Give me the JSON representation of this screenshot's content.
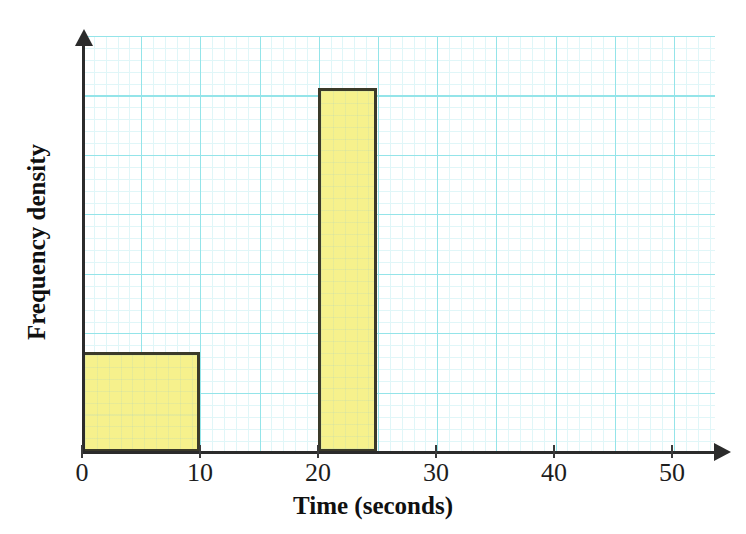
{
  "chart_data": {
    "type": "bar",
    "title": "",
    "xlabel": "Time (seconds)",
    "ylabel": "Frequency density",
    "xlim": [
      0,
      55
    ],
    "ylim": [
      0,
      4.4
    ],
    "grid": true,
    "legend": "none",
    "xticks": [
      0,
      10,
      20,
      30,
      40,
      50
    ],
    "xtick_labels": [
      "0",
      "10",
      "20",
      "30",
      "40",
      "50"
    ],
    "yticks": [],
    "ytick_labels": [],
    "bars": [
      {
        "label": "0-10",
        "x_start": 0,
        "x_end": 10,
        "value": 1.0
      },
      {
        "label": "20-25",
        "x_start": 20,
        "x_end": 25,
        "value": 3.64
      }
    ],
    "colors": {
      "bar_fill": "#f6f18c",
      "bar_outline": "#3b3a29",
      "grid_major": "#8fe3e8",
      "grid_minor": "#dff6f8",
      "axis": "#2b2b2b",
      "text": "#101010"
    }
  },
  "header_fragment": {
    "part_a": "",
    "part_b": "",
    "part_c": ""
  }
}
